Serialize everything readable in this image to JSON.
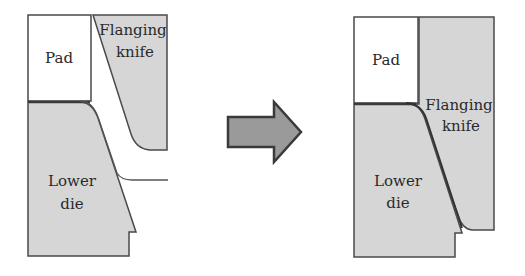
{
  "diagram": {
    "colors": {
      "fill_gray": "#d6d6d6",
      "outline": "#4a4a4a",
      "pad_fill": "#ffffff",
      "arrow_fill": "#9a9a9a",
      "arrow_outline": "#3a3a3a"
    },
    "before": {
      "pad_label": "Pad",
      "knife_label_line1": "Flanging",
      "knife_label_line2": "knife",
      "die_label_line1": "Lower",
      "die_label_line2": "die"
    },
    "transition": {
      "arrow_icon": "right-arrow-icon"
    },
    "after": {
      "pad_label": "Pad",
      "knife_label_line1": "Flanging",
      "knife_label_line2": "knife",
      "die_label_line1": "Lower",
      "die_label_line2": "die"
    }
  }
}
